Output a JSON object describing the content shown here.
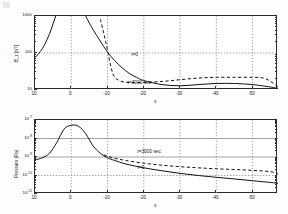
{
  "figure": {
    "background": "#fdfdfd",
    "curve_color": "#121212",
    "grid_color": "#8a8a8a",
    "axis_color": "#2b2b2b"
  },
  "panels": [
    {
      "id": "top-panel",
      "ylabel": "B_z [nT]",
      "xlabel": "x",
      "y_ticks": [
        "1000",
        "100",
        "10"
      ],
      "x_ticks": [
        "10",
        "0",
        "-10",
        "-20",
        "-30",
        "-40",
        "-50"
      ],
      "annotations": [
        {
          "text": "t=0",
          "x": 0.4,
          "y": 0.5
        },
        {
          "text": "t=3000 sec",
          "x": 0.385,
          "y": 0.875
        }
      ]
    },
    {
      "id": "bottom-panel",
      "ylabel": "Pressure (Pa)",
      "xlabel": "x",
      "y_tick_bases": [
        "10",
        "10",
        "10",
        "10",
        "10"
      ],
      "y_tick_exponents": [
        "-7",
        "-8",
        "-9",
        "-10",
        "-11"
      ],
      "x_ticks": [
        "10",
        "0",
        "-10",
        "-20",
        "-30",
        "-40",
        "-50"
      ],
      "annotations": [
        {
          "text": "t=3000 sec",
          "x": 0.425,
          "y": 0.4
        },
        {
          "text": "t=0",
          "x": 0.425,
          "y": 0.615
        }
      ]
    }
  ],
  "chart_data": [
    {
      "type": "line",
      "title": "",
      "xlabel": "x",
      "ylabel": "B_z [nT]",
      "yscale": "log",
      "ylim": [
        10,
        1000
      ],
      "xlim": [
        10,
        -57
      ],
      "x_reversed": true,
      "grid": true,
      "legend_position": "inline-annotation",
      "series": [
        {
          "name": "t=0",
          "style": "solid",
          "x": [
            10,
            8,
            6,
            4,
            2,
            0,
            -2,
            -4,
            -6,
            -8,
            -10,
            -12,
            -14,
            -16,
            -18,
            -20,
            -25,
            -30,
            -35,
            -40,
            -45,
            -50,
            -55,
            -57
          ],
          "values": [
            75,
            130,
            330,
            1200,
            4000,
            9000,
            3000,
            1000,
            430,
            210,
            105,
            62,
            40,
            28,
            22,
            18,
            14,
            13,
            14,
            15,
            15,
            14,
            12,
            11
          ]
        },
        {
          "name": "t=3000 sec",
          "style": "dashed",
          "x": [
            -8,
            -9,
            -10,
            -11,
            -12,
            -14,
            -16,
            -18,
            -20,
            -25,
            -30,
            -35,
            -40,
            -45,
            -50,
            -53,
            -55,
            -57
          ],
          "values": [
            820,
            330,
            120,
            40,
            22,
            17,
            16,
            16,
            16,
            17,
            19,
            21,
            22,
            22,
            22,
            21,
            17,
            12
          ]
        }
      ]
    },
    {
      "type": "line",
      "title": "",
      "xlabel": "x",
      "ylabel": "Pressure (Pa)",
      "yscale": "log",
      "ylim": [
        1e-11,
        1e-07
      ],
      "xlim": [
        10,
        -57
      ],
      "x_reversed": true,
      "grid": true,
      "legend_position": "inline-annotation",
      "series": [
        {
          "name": "t=0",
          "style": "solid",
          "x": [
            10,
            8,
            6,
            4,
            2,
            0,
            -2,
            -4,
            -6,
            -8,
            -10,
            -12,
            -15,
            -20,
            -25,
            -30,
            -35,
            -40,
            -45,
            -50,
            -55,
            -57
          ],
          "values": [
            7e-10,
            9e-10,
            1.6e-09,
            6e-09,
            3.2e-08,
            5.2e-08,
            4.6e-08,
            1.8e-08,
            4e-09,
            1.6e-09,
            9e-10,
            6.5e-10,
            4.2e-10,
            2.6e-10,
            1.8e-10,
            1.3e-10,
            1e-10,
            8e-11,
            6.5e-11,
            5.2e-11,
            4.2e-11,
            3.8e-11
          ]
        },
        {
          "name": "t=3000 sec",
          "style": "dashed",
          "x": [
            -9,
            -10,
            -12,
            -15,
            -20,
            -25,
            -30,
            -35,
            -40,
            -45,
            -50,
            -55,
            -57
          ],
          "values": [
            1.3e-09,
            1.1e-09,
            8.5e-10,
            6.5e-10,
            4.6e-10,
            3.6e-10,
            3e-10,
            2.6e-10,
            2.3e-10,
            2.1e-10,
            1.9e-10,
            1.6e-10,
            1.2e-10
          ]
        }
      ]
    }
  ]
}
